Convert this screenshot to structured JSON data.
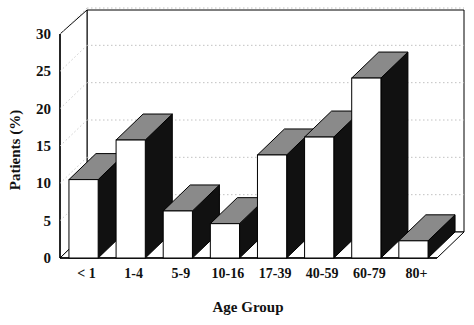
{
  "chart_data": {
    "type": "bar",
    "title": "",
    "subtitle": "",
    "xlabel": "Age Group",
    "ylabel": "Patients (%)",
    "categories": [
      "< 1",
      "1-4",
      "5-9",
      "10-16",
      "17-39",
      "40-59",
      "60-79",
      "80+"
    ],
    "values": [
      10.5,
      15.8,
      6.3,
      4.6,
      13.8,
      16.2,
      24.1,
      2.3
    ],
    "ylim": [
      0,
      30
    ],
    "yticks": [
      0,
      5,
      10,
      15,
      20,
      25,
      30
    ],
    "ytick_labels": [
      "0",
      "5",
      "10",
      "15",
      "20",
      "25",
      "30"
    ],
    "grid": true,
    "grid_style": "dotted-horizontal",
    "legend": false,
    "legend_position": "none",
    "render": "3d-bar",
    "colors": {
      "bar_front": "#ffffff",
      "bar_top": "#8a8a8a",
      "bar_side": "#111111",
      "outline": "#000000",
      "grid": "#bbbbbb",
      "text": "#111111",
      "background": "#ffffff"
    }
  },
  "axes": {
    "y_title": "Patients (%)",
    "x_title": "Age Group"
  }
}
